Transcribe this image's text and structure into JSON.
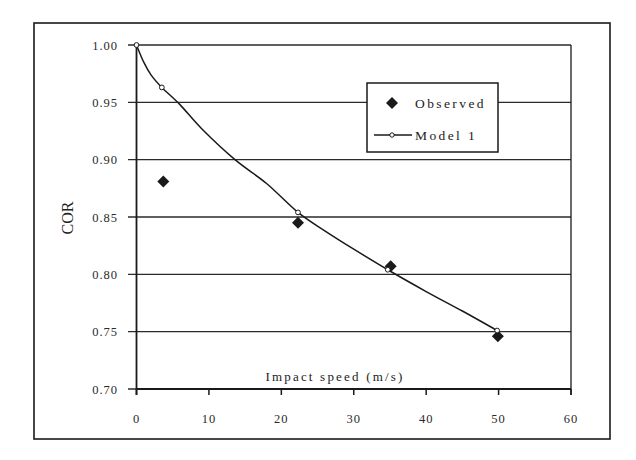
{
  "chart_data": {
    "type": "scatter",
    "title": "",
    "xlabel": "Impact speed (m/s)",
    "ylabel": "COR",
    "xlim": [
      0,
      60
    ],
    "ylim": [
      0.7,
      1.0
    ],
    "x_ticks": [
      "0",
      "10",
      "20",
      "30",
      "40",
      "50",
      "60"
    ],
    "y_ticks": [
      "0.70",
      "0.75",
      "0.80",
      "0.85",
      "0.90",
      "0.95",
      "1.00"
    ],
    "grid": "horizontal",
    "legend_position": "upper right (inside plot)",
    "series": [
      {
        "name": "Observed",
        "marker": "filled-diamond",
        "line": false,
        "x": [
          3.7,
          22.3,
          35.1,
          49.9
        ],
        "y": [
          0.881,
          0.845,
          0.807,
          0.746
        ]
      },
      {
        "name": "Model 1",
        "marker": "open-circle",
        "line": true,
        "x": [
          0,
          3.5,
          22.3,
          34.7,
          49.8
        ],
        "y": [
          1.0,
          0.963,
          0.854,
          0.804,
          0.751
        ],
        "curve_path": {
          "x": [
            0,
            1,
            2,
            3.5,
            6,
            9,
            13.6,
            18,
            22.3,
            26,
            30,
            34.7,
            40,
            45,
            49.8
          ],
          "y": [
            1.0,
            0.985,
            0.974,
            0.963,
            0.948,
            0.927,
            0.9,
            0.879,
            0.854,
            0.838,
            0.822,
            0.804,
            0.785,
            0.768,
            0.751
          ]
        }
      }
    ]
  },
  "colors": {
    "ink": "#1a1a1a",
    "grid": "#2a2a2a",
    "background": "#ffffff"
  }
}
